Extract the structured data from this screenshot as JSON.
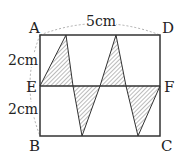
{
  "figure": {
    "points": {
      "A": "A",
      "B": "B",
      "C": "C",
      "D": "D",
      "E": "E",
      "F": "F"
    },
    "dimensions": {
      "top": "5cm",
      "upper_left": "2cm",
      "lower_left": "2cm"
    },
    "colors": {
      "line": "#333333",
      "hatch": "#555555",
      "dash": "#999999"
    }
  }
}
